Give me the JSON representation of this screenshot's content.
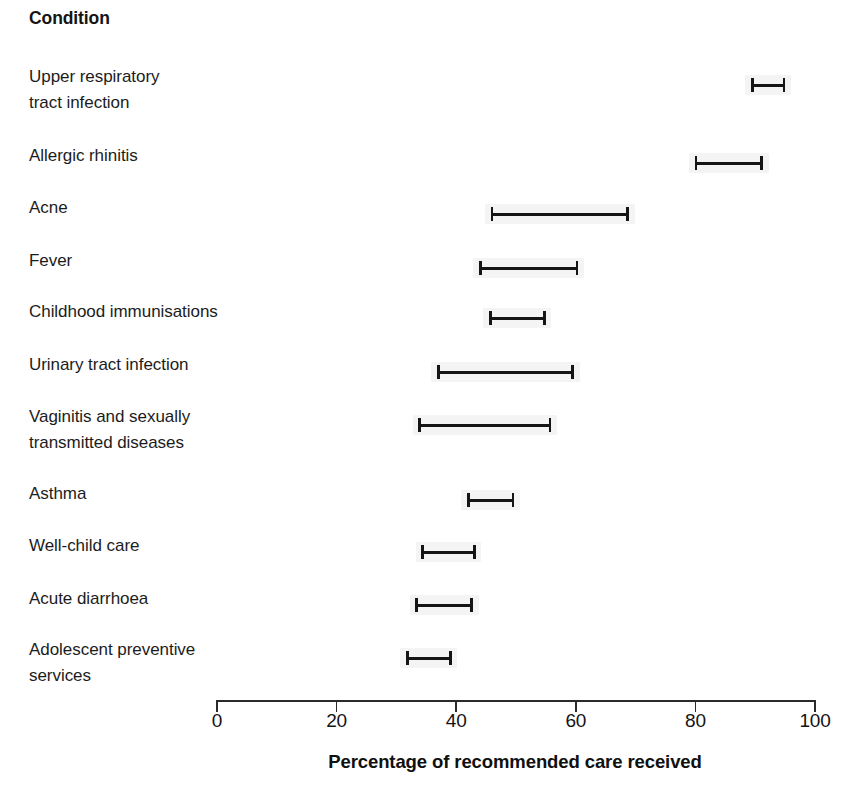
{
  "figure": {
    "column_header": "Condition",
    "axis_title": "Percentage of recommended care received"
  },
  "axis": {
    "ticks": [
      "0",
      "20",
      "40",
      "60",
      "80",
      "100"
    ],
    "tick_values": [
      0,
      20,
      40,
      60,
      80,
      100
    ],
    "min": 0,
    "max": 100,
    "pixel_left": 217,
    "pixel_right": 815
  },
  "chart_data": {
    "type": "errorbar",
    "title": "",
    "subtitle": "",
    "xlabel": "Percentage of recommended care received",
    "ylabel": "Condition",
    "xlim": [
      0,
      100
    ],
    "grid": false,
    "legend": "none",
    "orientation": "horizontal",
    "categories": [
      "Upper respiratory tract infection",
      "Allergic rhinitis",
      "Acne",
      "Fever",
      "Childhood immunisations",
      "Urinary tract infection",
      "Vaginitis and sexually transmitted diseases",
      "Asthma",
      "Well-child care",
      "Acute diarrhoea",
      "Adolescent preventive services"
    ],
    "series": [
      {
        "name": "Percentage of recommended care received",
        "low": [
          89.5,
          80.1,
          46.0,
          44.0,
          45.7,
          37.0,
          33.9,
          42.0,
          34.4,
          33.4,
          31.8
        ],
        "high": [
          94.8,
          91.1,
          68.7,
          60.2,
          54.7,
          59.5,
          55.7,
          49.5,
          43.0,
          42.6,
          39.0
        ]
      }
    ],
    "rows": [
      {
        "label": "Upper respiratory\ntract infection",
        "label_lines": 2,
        "low": 89.5,
        "high": 94.8,
        "label_top": 64,
        "bar_top": 75
      },
      {
        "label": "Allergic rhinitis",
        "label_lines": 1,
        "low": 80.1,
        "high": 91.1,
        "label_top": 143,
        "bar_top": 153
      },
      {
        "label": "Acne",
        "label_lines": 1,
        "low": 46.0,
        "high": 68.7,
        "label_top": 195,
        "bar_top": 204
      },
      {
        "label": "Fever",
        "label_lines": 1,
        "low": 44.0,
        "high": 60.2,
        "label_top": 248,
        "bar_top": 258
      },
      {
        "label": "Childhood immunisations",
        "label_lines": 1,
        "low": 45.7,
        "high": 54.7,
        "label_top": 299,
        "bar_top": 308
      },
      {
        "label": "Urinary tract infection",
        "label_lines": 1,
        "low": 37.0,
        "high": 59.5,
        "label_top": 352,
        "bar_top": 362
      },
      {
        "label": "Vaginitis and sexually\ntransmitted diseases",
        "label_lines": 2,
        "low": 33.9,
        "high": 55.7,
        "label_top": 404,
        "bar_top": 415
      },
      {
        "label": "Asthma",
        "label_lines": 1,
        "low": 42.0,
        "high": 49.5,
        "label_top": 481,
        "bar_top": 490
      },
      {
        "label": "Well-child care",
        "label_lines": 1,
        "low": 34.4,
        "high": 43.0,
        "label_top": 533,
        "bar_top": 542
      },
      {
        "label": "Acute diarrhoea",
        "label_lines": 1,
        "low": 33.4,
        "high": 42.6,
        "label_top": 586,
        "bar_top": 595
      },
      {
        "label": "Adolescent preventive\nservices",
        "label_lines": 2,
        "low": 31.8,
        "high": 39.0,
        "label_top": 637,
        "bar_top": 648
      }
    ]
  },
  "colors": {
    "background": "#ffffff",
    "marker": "#151515",
    "axis": "#2b2b2b",
    "text": "#1c1c1c",
    "smudge": "rgba(0,0,0,0.045)"
  },
  "geometry": {
    "axis_y": 700,
    "tick_length": 12,
    "tick_label_y": 710
  }
}
